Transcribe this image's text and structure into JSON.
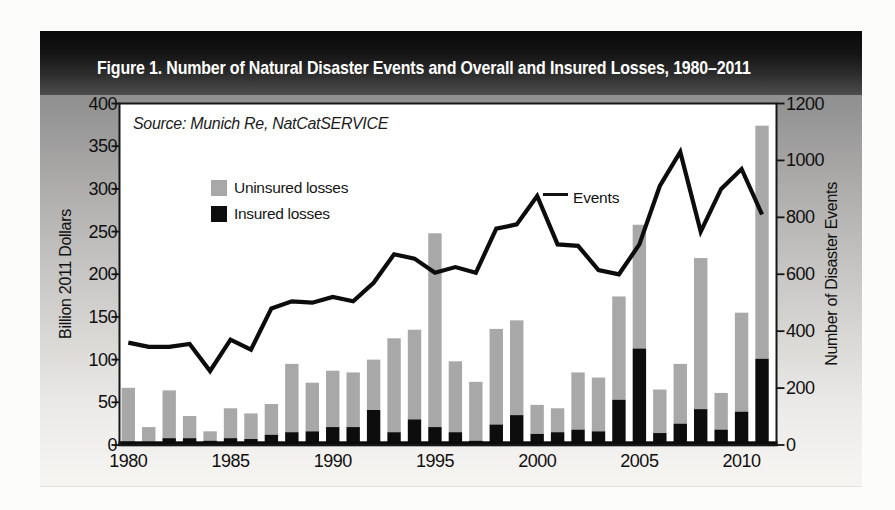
{
  "figure": {
    "title": "Figure 1. Number of Natural Disaster Events and Overall and Insured Losses, 1980–2011",
    "source_note": "Source: Munich Re, NatCatSERVICE",
    "events_label": "Events",
    "legend": {
      "uninsured_label": "Uninsured losses",
      "insured_label": "Insured losses"
    },
    "left_axis_title": "Billion 2011 Dollars",
    "right_axis_title": "Number of Disaster Events",
    "colors": {
      "uninsured_bar": "#a8a8a8",
      "insured_bar": "#0d0d0d",
      "events_line": "#0c0c0c",
      "header_top": "#0a0a0a",
      "header_bottom": "#4e4e4e",
      "plot_background": "#ffffff",
      "axis_ink": "#141414"
    }
  },
  "chart_data": {
    "type": "combo: stacked bar (losses) + line (events)",
    "title": "Figure 1. Number of Natural Disaster Events and Overall and Insured Losses, 1980–2011",
    "source": "Source: Munich Re, NatCatSERVICE",
    "grid": false,
    "legend_position": "inside upper-left",
    "x": [
      1980,
      1981,
      1982,
      1983,
      1984,
      1985,
      1986,
      1987,
      1988,
      1989,
      1990,
      1991,
      1992,
      1993,
      1994,
      1995,
      1996,
      1997,
      1998,
      1999,
      2000,
      2001,
      2002,
      2003,
      2004,
      2005,
      2006,
      2007,
      2008,
      2009,
      2010,
      2011
    ],
    "x_tick_labels": [
      "1980",
      "1985",
      "1990",
      "1995",
      "2000",
      "2005",
      "2010"
    ],
    "left_axis": {
      "title": "Billion 2011 Dollars",
      "min": 0,
      "max": 400,
      "ticks": [
        0,
        50,
        100,
        150,
        200,
        250,
        300,
        350,
        400
      ]
    },
    "right_axis": {
      "title": "Number of Disaster Events",
      "min": 0,
      "max": 1200,
      "ticks": [
        0,
        200,
        400,
        600,
        800,
        1000,
        1200
      ]
    },
    "series": [
      {
        "name": "Insured losses",
        "type": "bar",
        "stack": "losses",
        "axis": "left",
        "color": "#0d0d0d",
        "values": [
          4,
          3,
          8,
          8,
          5,
          8,
          7,
          12,
          15,
          16,
          21,
          21,
          41,
          15,
          30,
          21,
          15,
          5,
          24,
          35,
          13,
          15,
          18,
          16,
          53,
          113,
          14,
          25,
          42,
          18,
          39,
          101
        ]
      },
      {
        "name": "Uninsured losses",
        "type": "bar",
        "stack": "losses",
        "axis": "left",
        "color": "#a8a8a8",
        "values": [
          63,
          18,
          56,
          26,
          11,
          35,
          30,
          36,
          80,
          57,
          66,
          64,
          59,
          110,
          105,
          227,
          83,
          69,
          112,
          111,
          34,
          28,
          67,
          63,
          121,
          145,
          51,
          70,
          177,
          43,
          116,
          273
        ]
      },
      {
        "name": "Events",
        "type": "line",
        "axis": "right",
        "color": "#0c0c0c",
        "values": [
          360,
          345,
          345,
          355,
          260,
          370,
          335,
          480,
          505,
          500,
          520,
          505,
          570,
          670,
          655,
          605,
          625,
          605,
          760,
          775,
          875,
          705,
          700,
          615,
          600,
          705,
          910,
          1030,
          750,
          900,
          970,
          810
        ]
      }
    ],
    "total_overall_losses": [
      67,
      21,
      64,
      34,
      16,
      43,
      37,
      48,
      95,
      73,
      87,
      85,
      100,
      125,
      135,
      248,
      98,
      74,
      136,
      146,
      47,
      43,
      85,
      79,
      174,
      258,
      65,
      95,
      219,
      61,
      155,
      374
    ],
    "annotation": {
      "label": "Events",
      "attached_to_year": 2000,
      "attached_to_value": 875
    }
  }
}
